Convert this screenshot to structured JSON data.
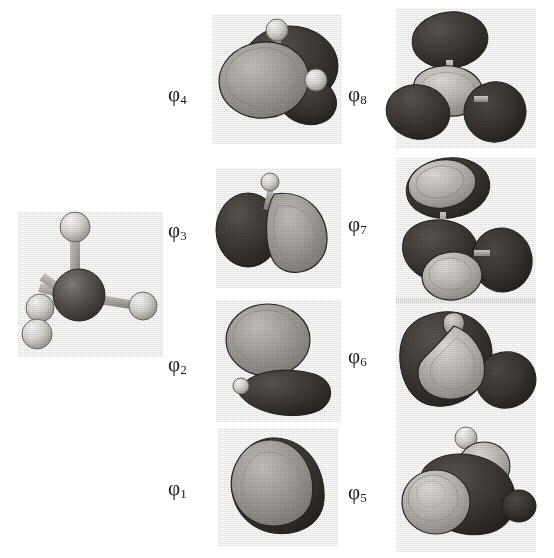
{
  "figure": {
    "background_color": "#ffffff",
    "molecule": {
      "name": "methane-ball-and-stick-model",
      "formula": "CH4",
      "center_atom": "C",
      "ligand_atom": "H",
      "ligand_count": 4,
      "carbon_color": "#5a5551",
      "hydrogen_color": "#e8e6e2",
      "bond_color": "#b9b5b0"
    },
    "orbital_colors": {
      "positive_lobe": "#a8a49f",
      "negative_lobe": "#3d3935",
      "lobe_outline": "#2a2724",
      "highlight": "#d8d5d0"
    },
    "columns": [
      {
        "name": "left-orbital-column",
        "orbitals": [
          "phi4",
          "phi3",
          "phi2",
          "phi1"
        ]
      },
      {
        "name": "right-orbital-column",
        "orbitals": [
          "phi8",
          "phi7",
          "phi6",
          "phi5"
        ]
      }
    ],
    "orbitals": {
      "phi1": {
        "symbol": "φ",
        "index": "1",
        "label": "φ1",
        "lobes_light": 1,
        "lobes_dark": 0,
        "hydrogens_visible": 0,
        "description": "single totally-symmetric rounded bonding lobe"
      },
      "phi2": {
        "symbol": "φ",
        "index": "2",
        "label": "φ2",
        "lobes_light": 1,
        "lobes_dark": 1,
        "hydrogens_visible": 1,
        "description": "upper light lobe above a lower dark kidney lobe"
      },
      "phi3": {
        "symbol": "φ",
        "index": "3",
        "label": "φ3",
        "lobes_light": 1,
        "lobes_dark": 1,
        "hydrogens_visible": 1,
        "description": "dark round lobe at left, light teardrop lobe at right"
      },
      "phi4": {
        "symbol": "φ",
        "index": "4",
        "label": "φ4",
        "lobes_light": 1,
        "lobes_dark": 2,
        "hydrogens_visible": 2,
        "description": "large light disc lobe overlapping dark lobes, two hydrogens"
      },
      "phi5": {
        "symbol": "φ",
        "index": "5",
        "label": "φ5",
        "lobes_light": 1,
        "lobes_dark": 3,
        "hydrogens_visible": 1,
        "description": "bright light sphere at left against dark antibonding lobes"
      },
      "phi6": {
        "symbol": "φ",
        "index": "6",
        "label": "φ6",
        "lobes_light": 1,
        "lobes_dark": 2,
        "hydrogens_visible": 0,
        "description": "elongated curving light lobe threading dark lobes"
      },
      "phi7": {
        "symbol": "φ",
        "index": "7",
        "label": "φ7",
        "lobes_light": 2,
        "lobes_dark": 3,
        "hydrogens_visible": 0,
        "description": "light lobes top and bottom centre with dark lobes between"
      },
      "phi8": {
        "symbol": "φ",
        "index": "8",
        "label": "φ8",
        "lobes_light": 1,
        "lobes_dark": 3,
        "hydrogens_visible": 0,
        "description": "three dark outer lobes around a light central lobe"
      }
    }
  }
}
